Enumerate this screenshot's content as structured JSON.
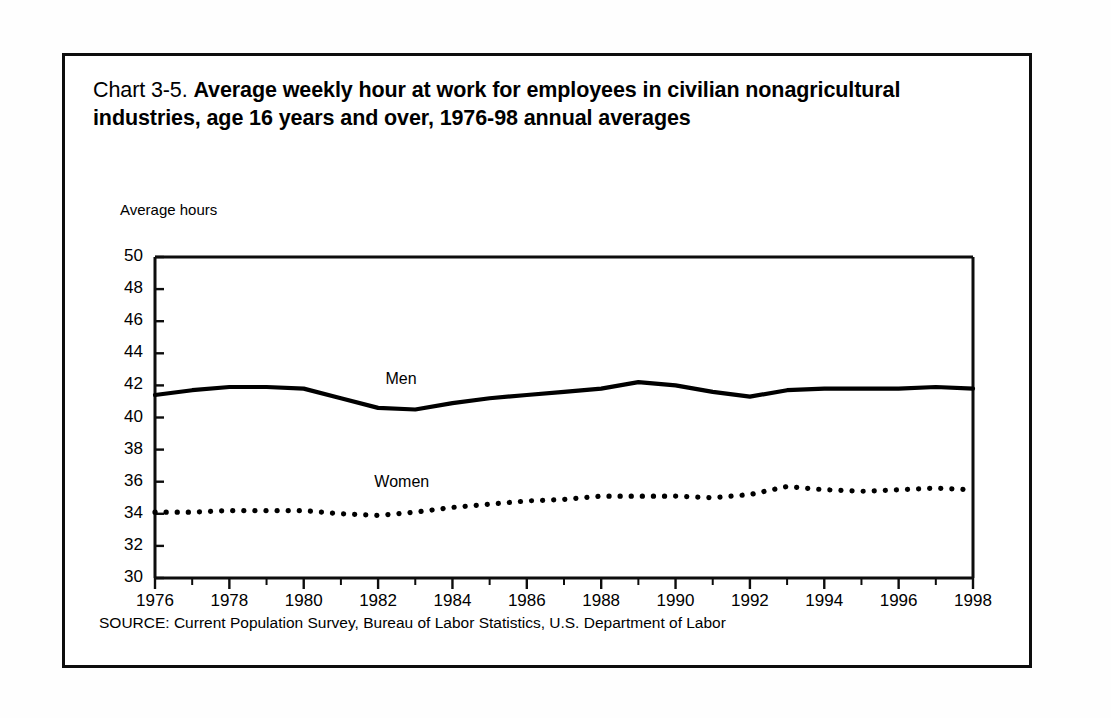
{
  "chart": {
    "number_label": "Chart 3-5.",
    "headline": "Average weekly hour at work for employees in civilian nonagricultural industries, age 16 years and over, 1976-98 annual averages",
    "y_axis_caption": "Average hours",
    "source_note": "SOURCE: Current Population Survey, Bureau of Labor Statistics, U.S. Department of Labor",
    "ink_color": "#000000",
    "paper_color": "#ffffff"
  },
  "chart_data": {
    "type": "line",
    "title": "Chart 3-5. Average weekly hour at work for employees in civilian nonagricultural industries, age 16 years and over, 1976-98 annual averages",
    "subtitle": "",
    "xlabel": "",
    "ylabel": "Average hours",
    "xlim": [
      1976,
      1998
    ],
    "ylim": [
      30,
      50
    ],
    "grid": false,
    "legend_position": "inline-annotation",
    "y_ticks": [
      30,
      32,
      34,
      36,
      38,
      40,
      42,
      44,
      46,
      48,
      50
    ],
    "x_ticks_major": [
      1976,
      1978,
      1980,
      1982,
      1984,
      1986,
      1988,
      1990,
      1992,
      1994,
      1996,
      1998
    ],
    "x_ticks_minor": [
      1977,
      1979,
      1981,
      1983,
      1985,
      1987,
      1989,
      1991,
      1993,
      1995,
      1997
    ],
    "x": [
      1976,
      1977,
      1978,
      1979,
      1980,
      1981,
      1982,
      1983,
      1984,
      1985,
      1986,
      1987,
      1988,
      1989,
      1990,
      1991,
      1992,
      1993,
      1994,
      1995,
      1996,
      1997,
      1998
    ],
    "series": [
      {
        "name": "Men",
        "style": "solid",
        "color": "#000000",
        "label_text": "Men",
        "values": [
          41.4,
          41.7,
          41.9,
          41.9,
          41.8,
          41.2,
          40.6,
          40.5,
          40.9,
          41.2,
          41.4,
          41.6,
          41.8,
          42.2,
          42.0,
          41.6,
          41.3,
          41.7,
          41.8,
          41.8,
          41.8,
          41.9,
          41.8
        ]
      },
      {
        "name": "Women",
        "style": "dotted",
        "color": "#000000",
        "label_text": "Women",
        "values": [
          34.1,
          34.1,
          34.2,
          34.2,
          34.2,
          34.0,
          33.9,
          34.1,
          34.4,
          34.6,
          34.8,
          34.9,
          35.1,
          35.1,
          35.1,
          35.0,
          35.2,
          35.7,
          35.5,
          35.4,
          35.5,
          35.6,
          35.5
        ]
      }
    ]
  },
  "axis": {
    "y_tick_labels": [
      "50",
      "48",
      "46",
      "44",
      "42",
      "40",
      "38",
      "36",
      "34",
      "32",
      "30"
    ],
    "x_tick_labels": [
      "1976",
      "1978",
      "1980",
      "1982",
      "1984",
      "1986",
      "1988",
      "1990",
      "1992",
      "1994",
      "1996",
      "1998"
    ]
  }
}
